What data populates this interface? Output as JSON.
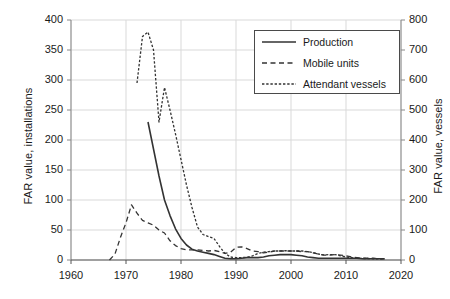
{
  "chart_data": {
    "type": "line",
    "title": "",
    "xlabel": "",
    "ylabel": "FAR value, installations",
    "ylabel_secondary": "FAR value, vessels",
    "xlim": [
      1960,
      2020
    ],
    "ylim": [
      0,
      400
    ],
    "ylim_secondary": [
      0,
      800
    ],
    "xticks": [
      1960,
      1970,
      1980,
      1990,
      2000,
      2010,
      2020
    ],
    "yticks": [
      0,
      50,
      100,
      150,
      200,
      250,
      300,
      350,
      400
    ],
    "yticks_secondary": [
      0,
      100,
      200,
      300,
      400,
      500,
      600,
      700,
      800
    ],
    "grid": true,
    "legend_position": "upper right",
    "series": [
      {
        "name": "Production",
        "axis": "left",
        "style": "solid",
        "color": "#333333",
        "x": [
          1974,
          1975,
          1976,
          1977,
          1978,
          1979,
          1980,
          1981,
          1982,
          1983,
          1984,
          1985,
          1986,
          1987,
          1988,
          1989,
          1990,
          1991,
          1992,
          1993,
          1994,
          1995,
          1996,
          1997,
          1998,
          1999,
          2000,
          2001,
          2002,
          2003,
          2004,
          2005,
          2006,
          2007,
          2008,
          2009,
          2010,
          2011,
          2012,
          2013,
          2014,
          2015,
          2016,
          2017
        ],
        "values": [
          230,
          185,
          140,
          100,
          74,
          52,
          36,
          25,
          18,
          15,
          13,
          11,
          9,
          6,
          3,
          2,
          2,
          3,
          4,
          4,
          4,
          5,
          7,
          8,
          9,
          9,
          9,
          8,
          7,
          5,
          4,
          3,
          3,
          3,
          3,
          3,
          3,
          3,
          3,
          2,
          2,
          2,
          2,
          2
        ]
      },
      {
        "name": "Mobile units",
        "axis": "left",
        "style": "dashed",
        "color": "#333333",
        "x": [
          1967,
          1968,
          1969,
          1970,
          1971,
          1972,
          1973,
          1974,
          1975,
          1976,
          1977,
          1978,
          1979,
          1980,
          1981,
          1982,
          1983,
          1984,
          1985,
          1986,
          1987,
          1988,
          1989,
          1990,
          1991,
          1992,
          1993,
          1994,
          1995,
          1996,
          1997,
          1998,
          1999,
          2000,
          2001,
          2002,
          2003,
          2004,
          2005,
          2006,
          2007,
          2008,
          2009,
          2010,
          2011,
          2012,
          2013,
          2014,
          2015,
          2016,
          2017
        ],
        "values": [
          0,
          10,
          38,
          62,
          92,
          78,
          66,
          62,
          58,
          50,
          45,
          32,
          24,
          19,
          17,
          17,
          17,
          16,
          15,
          16,
          14,
          11,
          13,
          21,
          22,
          19,
          15,
          14,
          12,
          13,
          15,
          15,
          15,
          15,
          15,
          14,
          14,
          12,
          10,
          8,
          8,
          9,
          8,
          7,
          5,
          4,
          3,
          3,
          3,
          2,
          2
        ]
      },
      {
        "name": "Attendant vessels",
        "axis": "right",
        "style": "dotted",
        "color": "#333333",
        "x": [
          1972,
          1973,
          1974,
          1975,
          1976,
          1977,
          1978,
          1979,
          1980,
          1981,
          1982,
          1983,
          1984,
          1985,
          1986,
          1987,
          1988,
          1989,
          1990,
          1991,
          1992,
          1993,
          1994,
          1995,
          1996,
          1997,
          1998,
          1999,
          2000,
          2001,
          2002,
          2003,
          2004,
          2005,
          2006,
          2007,
          2008,
          2009,
          2010,
          2011,
          2012,
          2013,
          2014,
          2015,
          2016,
          2017
        ],
        "values": [
          590,
          745,
          760,
          700,
          460,
          575,
          500,
          420,
          335,
          250,
          175,
          110,
          85,
          78,
          72,
          45,
          22,
          10,
          8,
          8,
          9,
          14,
          22,
          26,
          28,
          30,
          30,
          31,
          30,
          30,
          30,
          28,
          25,
          20,
          17,
          18,
          18,
          14,
          10,
          8,
          6,
          5,
          5,
          4,
          4,
          4
        ]
      }
    ]
  },
  "legend": {
    "items": [
      {
        "label": "Production",
        "style": "solid"
      },
      {
        "label": "Mobile units",
        "style": "dashed"
      },
      {
        "label": "Attendant vessels",
        "style": "dotted"
      }
    ]
  },
  "axes": {
    "left_title": "FAR value, installations",
    "right_title": "FAR value, vessels",
    "left_ticks": [
      "400",
      "350",
      "300",
      "250",
      "200",
      "150",
      "100",
      "50",
      "0"
    ],
    "right_ticks": [
      "800",
      "700",
      "600",
      "500",
      "400",
      "300",
      "200",
      "100",
      "0"
    ],
    "bottom_ticks": [
      "1960",
      "1970",
      "1980",
      "1990",
      "2000",
      "2010",
      "2020"
    ]
  },
  "colors": {
    "line": "#333333",
    "grid": "#d9d9d9",
    "axis": "#888888",
    "text": "#1a1a1a",
    "background": "#ffffff"
  }
}
